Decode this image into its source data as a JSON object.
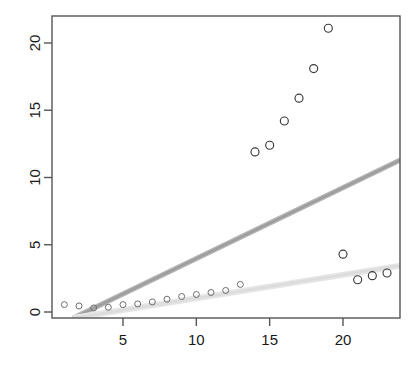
{
  "chart_data": {
    "type": "scatter",
    "title": "",
    "subtitle": "",
    "xlabel": "",
    "ylabel": "",
    "xlim": [
      0.3,
      23.9
    ],
    "ylim": [
      -0.6,
      21.9
    ],
    "grid": false,
    "legend": null,
    "xticks": [
      5,
      10,
      15,
      20
    ],
    "yticks": [
      0,
      5,
      10,
      15,
      20
    ],
    "xtick_labels": [
      "5",
      "10",
      "15",
      "20"
    ],
    "ytick_labels": [
      "0",
      "5",
      "10",
      "15",
      "20"
    ],
    "series": [
      {
        "name": "observed",
        "marker": "open-circle",
        "color": "#3a3a3a",
        "points": [
          {
            "x": 1.0,
            "y": 0.55
          },
          {
            "x": 2.0,
            "y": 0.45
          },
          {
            "x": 3.0,
            "y": 0.3
          },
          {
            "x": 4.0,
            "y": 0.35
          },
          {
            "x": 5.0,
            "y": 0.55
          },
          {
            "x": 6.0,
            "y": 0.6
          },
          {
            "x": 7.0,
            "y": 0.75
          },
          {
            "x": 8.0,
            "y": 0.95
          },
          {
            "x": 9.0,
            "y": 1.15
          },
          {
            "x": 10.0,
            "y": 1.3
          },
          {
            "x": 11.0,
            "y": 1.45
          },
          {
            "x": 12.0,
            "y": 1.6
          },
          {
            "x": 13.0,
            "y": 2.05
          },
          {
            "x": 14.0,
            "y": 11.9
          },
          {
            "x": 15.0,
            "y": 12.4
          },
          {
            "x": 16.0,
            "y": 14.2
          },
          {
            "x": 17.0,
            "y": 15.9
          },
          {
            "x": 18.0,
            "y": 18.1
          },
          {
            "x": 19.0,
            "y": 21.1
          },
          {
            "x": 20.0,
            "y": 4.3
          },
          {
            "x": 21.0,
            "y": 2.4
          },
          {
            "x": 22.0,
            "y": 2.7
          },
          {
            "x": 23.0,
            "y": 2.9
          }
        ]
      }
    ],
    "bands": [
      {
        "name": "upper-reference-band",
        "color": "#9d9d9d",
        "line": [
          {
            "x": 1.6,
            "y": -0.45
          },
          {
            "x": 23.9,
            "y": 11.3
          }
        ]
      },
      {
        "name": "lower-reference-band",
        "color": "#dcdcdc",
        "line": [
          {
            "x": 1.6,
            "y": -0.45
          },
          {
            "x": 23.9,
            "y": 3.45
          }
        ]
      }
    ]
  },
  "axes": {
    "x_axis_name": "x-axis",
    "y_axis_name": "y-axis"
  }
}
